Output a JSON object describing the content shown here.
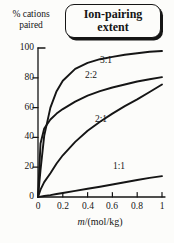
{
  "figure": {
    "title_box": {
      "line1": "Ion-pairing",
      "line2": "extent"
    },
    "y_axis_label": {
      "line1": "% cations",
      "line2": "paired"
    },
    "x_axis_label": {
      "italic": "m",
      "rest": "/(mol/kg)"
    }
  },
  "chart_data": {
    "type": "line",
    "title": "Ion-pairing extent",
    "xlabel": "m/(mol/kg)",
    "ylabel": "% cations paired",
    "xlim": [
      0,
      1
    ],
    "ylim": [
      0,
      100
    ],
    "grid": false,
    "legend_position": "inline-curve-labels",
    "line_color": "#151515",
    "xticks": [
      0,
      0.2,
      0.4,
      0.6,
      0.8,
      1
    ],
    "xtick_labels": [
      "0",
      "0.2",
      "0.4",
      "0.6",
      "0.8",
      "1"
    ],
    "yticks": [
      0,
      20,
      40,
      60,
      80,
      100
    ],
    "ytick_labels": [
      "0",
      "20",
      "40",
      "60",
      "80",
      "100"
    ],
    "x": [
      0,
      0.02,
      0.05,
      0.1,
      0.15,
      0.2,
      0.3,
      0.4,
      0.5,
      0.6,
      0.7,
      0.8,
      0.9,
      1
    ],
    "series": [
      {
        "id": "3-1",
        "name": "3:1",
        "values": [
          0,
          18,
          41,
          60,
          71,
          78,
          86,
          90,
          92.5,
          94,
          95.5,
          96.5,
          97.5,
          98
        ]
      },
      {
        "id": "2-2",
        "name": "2:2",
        "values": [
          0,
          36,
          46,
          52,
          56,
          59,
          64,
          68,
          71,
          73.5,
          75.5,
          77.5,
          79,
          80.5
        ]
      },
      {
        "id": "2-1",
        "name": "2:1",
        "values": [
          0,
          5,
          10,
          16,
          22.5,
          28,
          37,
          44.5,
          50.5,
          56,
          61,
          65.5,
          70.5,
          75.5
        ]
      },
      {
        "id": "1-1",
        "name": "1:1",
        "values": [
          0,
          0.3,
          0.7,
          1.3,
          2,
          2.7,
          4.1,
          5.5,
          6.9,
          8.4,
          9.9,
          11.4,
          12.8,
          14
        ]
      }
    ]
  }
}
